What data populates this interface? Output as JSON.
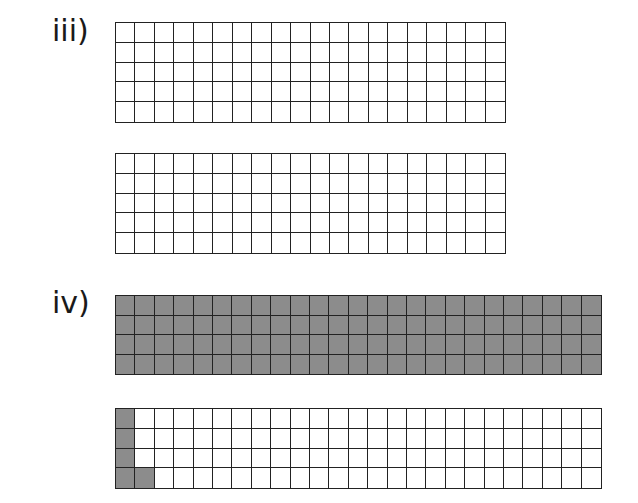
{
  "sections": [
    {
      "label": "iii)",
      "grids": [
        {
          "rows": 5,
          "cols": 20,
          "shaded_cells": []
        },
        {
          "rows": 5,
          "cols": 20,
          "shaded_cells": []
        }
      ]
    },
    {
      "label": "iv)",
      "grids": [
        {
          "rows": 4,
          "cols": 25,
          "shaded_all": true,
          "shaded_cells": "all"
        },
        {
          "rows": 4,
          "cols": 25,
          "shaded_cells": [
            [
              0,
              0
            ],
            [
              1,
              0
            ],
            [
              2,
              0
            ],
            [
              3,
              0
            ],
            [
              3,
              1
            ]
          ]
        }
      ]
    }
  ],
  "colors": {
    "shade": "#8c8c8c",
    "line": "#222222",
    "empty": "#ffffff"
  }
}
